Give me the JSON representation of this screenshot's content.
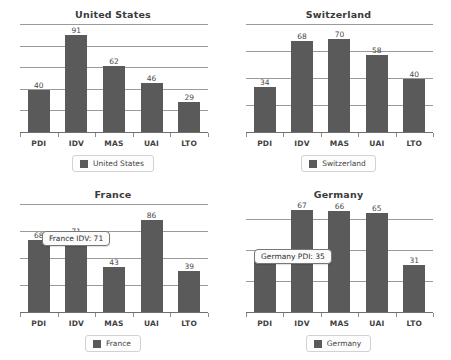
{
  "chart_data": [
    {
      "type": "bar",
      "title": "United States",
      "categories": [
        "PDI",
        "IDV",
        "MAS",
        "UAI",
        "LTO"
      ],
      "values": [
        40,
        91,
        62,
        46,
        29
      ],
      "series": [
        {
          "name": "United States",
          "values": [
            40,
            91,
            62,
            46,
            29
          ]
        }
      ],
      "legend": "United States",
      "legend_position": "bottom",
      "xlabel": "",
      "ylabel": "",
      "ylim": [
        0,
        100
      ],
      "grid": true,
      "gridlines": [
        20,
        40,
        60,
        80,
        100
      ],
      "tooltip": null
    },
    {
      "type": "bar",
      "title": "Switzerland",
      "categories": [
        "PDI",
        "IDV",
        "MAS",
        "UAI",
        "LTO"
      ],
      "values": [
        34,
        68,
        70,
        58,
        40
      ],
      "series": [
        {
          "name": "Switzerland",
          "values": [
            34,
            68,
            70,
            58,
            40
          ]
        }
      ],
      "legend": "Switzerland",
      "legend_position": "bottom",
      "xlabel": "",
      "ylabel": "",
      "ylim": [
        0,
        80
      ],
      "grid": true,
      "gridlines": [
        20,
        40,
        60,
        80
      ],
      "tooltip": null
    },
    {
      "type": "bar",
      "title": "France",
      "categories": [
        "PDI",
        "IDV",
        "MAS",
        "UAI",
        "LTO"
      ],
      "values": [
        68,
        71,
        43,
        86,
        39
      ],
      "series": [
        {
          "name": "France",
          "values": [
            68,
            71,
            43,
            86,
            39
          ]
        }
      ],
      "legend": "France",
      "legend_position": "bottom",
      "xlabel": "",
      "ylabel": "",
      "ylim": [
        0,
        100
      ],
      "grid": true,
      "gridlines": [
        25,
        50,
        75,
        100
      ],
      "tooltip": "France IDV: 71"
    },
    {
      "type": "bar",
      "title": "Germany",
      "categories": [
        "PDI",
        "IDV",
        "MAS",
        "UAI",
        "LTO"
      ],
      "values": [
        35,
        67,
        66,
        65,
        31
      ],
      "series": [
        {
          "name": "Germany",
          "values": [
            35,
            67,
            66,
            65,
            31
          ]
        }
      ],
      "legend": "Germany",
      "legend_position": "bottom",
      "xlabel": "",
      "ylabel": "",
      "ylim": [
        0,
        70
      ],
      "grid": true,
      "gridlines": [
        20,
        40,
        60
      ],
      "tooltip": "Germany PDI: 35"
    }
  ],
  "style": {
    "bar_color": "#5a5a5a",
    "gridline_color": "#9a9a9a",
    "axis_color": "#6f6f6f",
    "title_color": "#3a3a3a",
    "label_color": "#4a4a4a",
    "background": "#ffffff"
  }
}
